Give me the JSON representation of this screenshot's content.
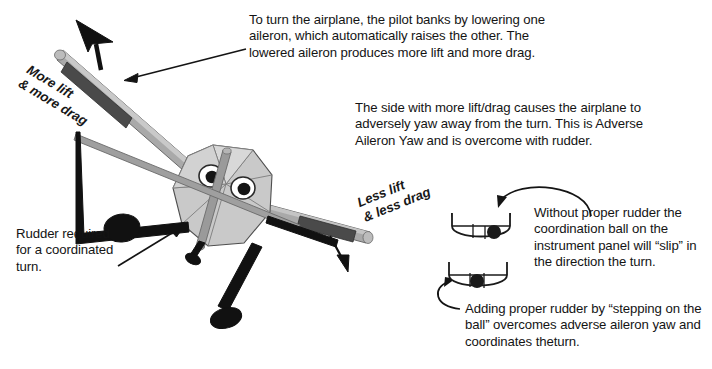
{
  "diagram": {
    "title": "Adverse Aileron Yaw",
    "palette": {
      "background": "#ffffff",
      "ink": "#141414",
      "wing_light": "#a9a9a9",
      "wing_highlight": "#c9c9c9",
      "aileron_dark": "#4a4a4a",
      "fuselage_fill": "#c4c4c4",
      "fuselage_light": "#d6d6d6",
      "gear_black": "#111111",
      "ball_black": "#1a1a1a",
      "instrument_stroke": "#1a1a1a"
    },
    "texts": {
      "bank_explanation": "To turn the airplane, the pilot banks by lowering one aileron, which automatically raises the other. The lowered aileron produces more lift and more drag.",
      "adverse_yaw": "The side with more lift/drag causes the airplane to adversely yaw away from the turn. This is Adverse Aileron Yaw and is overcome with rudder.",
      "without_rudder": "Without proper rudder the coordination ball on the instrument panel will “slip” in the direction the turn.",
      "adding_rudder": "Adding proper rudder by “stepping on the ball” overcomes adverse aileron yaw and coordinates theturn.",
      "rudder_required": "Rudder required for a coordinated turn."
    },
    "labels": {
      "more_lift": "More lift\n& more drag",
      "less_lift": "Less lift\n& less drag"
    },
    "instruments": [
      {
        "name": "inclinometer-slipping",
        "ball_position": "right",
        "state": "slipping"
      },
      {
        "name": "inclinometer-coordinated",
        "ball_position": "center",
        "state": "coordinated"
      }
    ],
    "aircraft": {
      "view": "front",
      "attitude": "banked-left",
      "left_wing": {
        "aileron": "lowered",
        "lift_arrow": "up"
      },
      "right_wing": {
        "aileron": "raised",
        "lift_arrow": "down"
      }
    }
  }
}
